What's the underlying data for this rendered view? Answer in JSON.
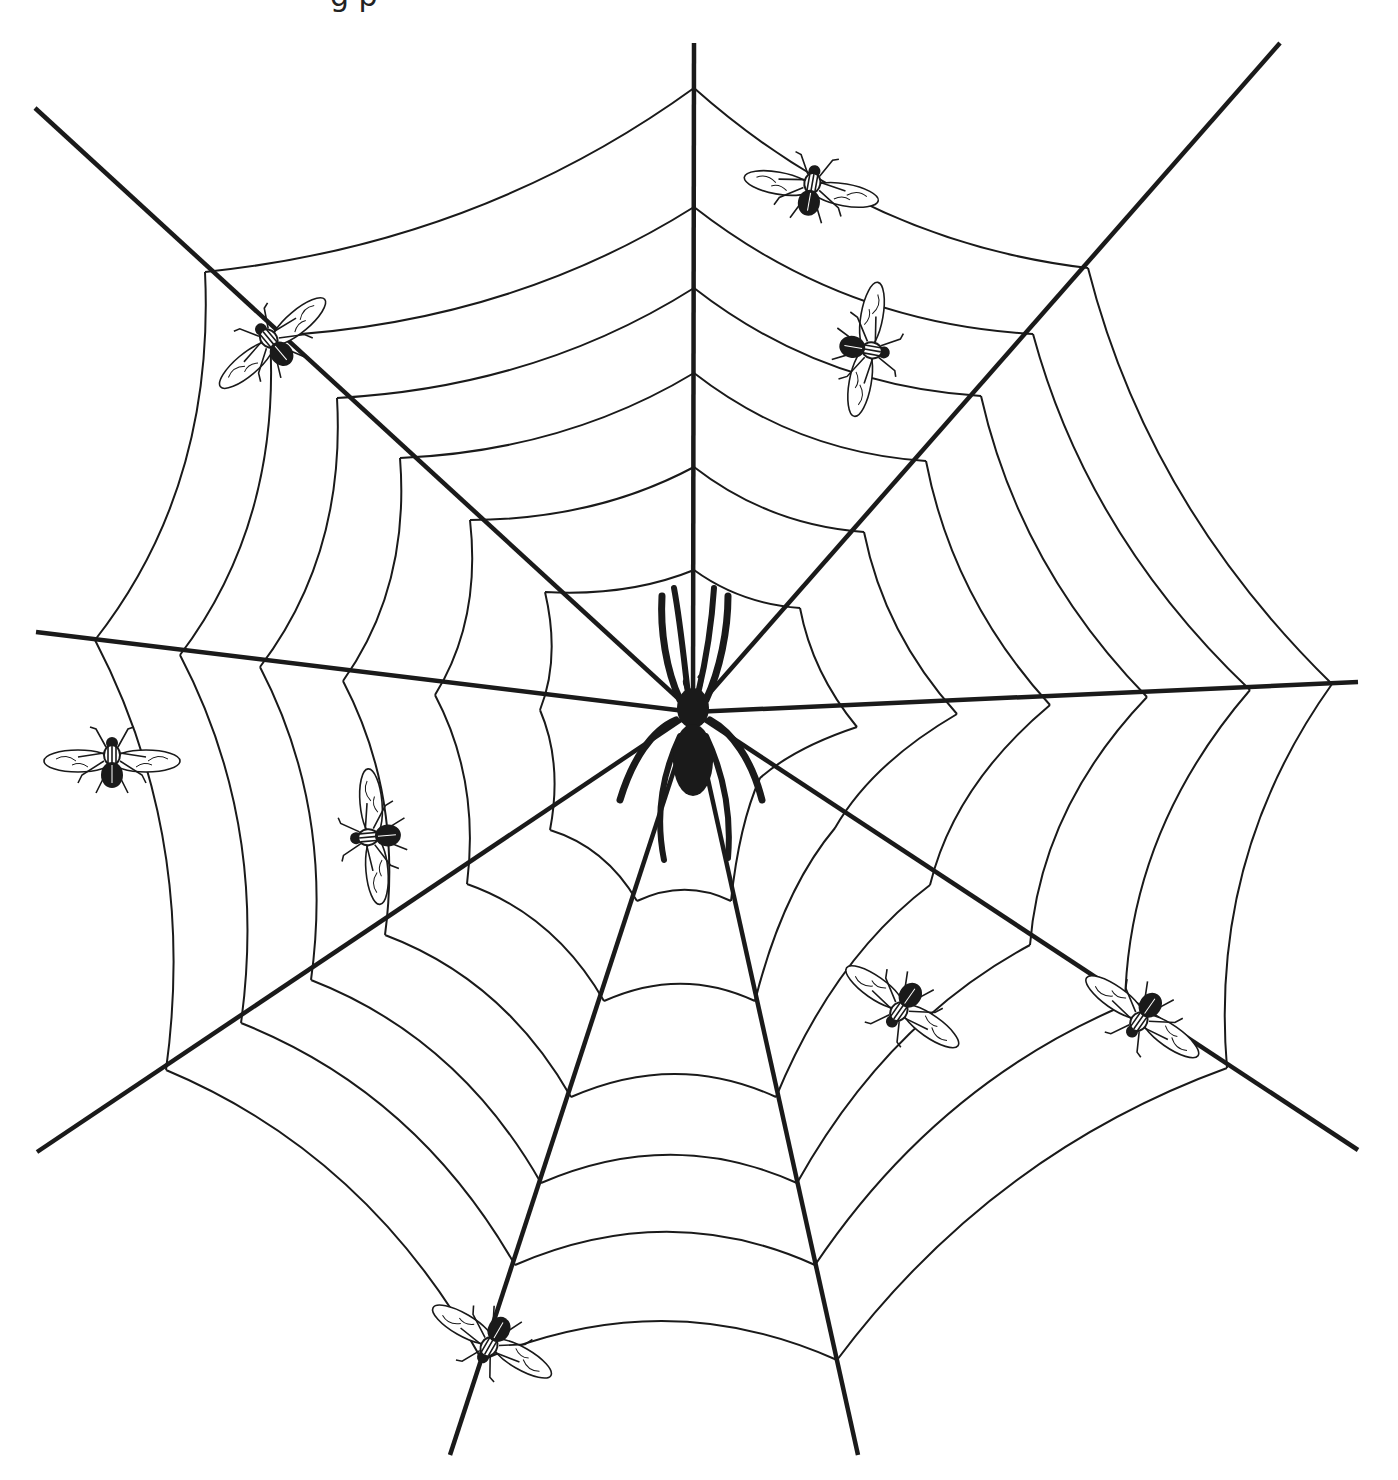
{
  "caption": {
    "text": "g        p",
    "note_visible": "only descenders of a cut-off text line are visible at the top edge"
  },
  "illustration": {
    "subject": "spider web with spider and flies",
    "colors": {
      "background": "#ffffff",
      "ink": "#1a1a1a"
    },
    "hub": [
      693,
      712
    ],
    "radials": [
      {
        "name": "top",
        "end": [
          694,
          43
        ]
      },
      {
        "name": "upper-right",
        "end": [
          1280,
          43
        ]
      },
      {
        "name": "right",
        "end": [
          1358,
          682
        ]
      },
      {
        "name": "lower-right",
        "end": [
          1358,
          1150
        ]
      },
      {
        "name": "bottom-right",
        "end": [
          858,
          1455
        ]
      },
      {
        "name": "bottom-left",
        "end": [
          450,
          1455
        ]
      },
      {
        "name": "lower-left",
        "end": [
          37,
          1152
        ]
      },
      {
        "name": "left",
        "end": [
          36,
          632
        ]
      },
      {
        "name": "upper-left",
        "end": [
          35,
          108
        ]
      }
    ],
    "rings": [
      [
        [
          694,
          88
        ],
        [
          1088,
          268
        ],
        [
          1332,
          684
        ],
        [
          1227,
          1068
        ],
        [
          837,
          1360
        ],
        [
          482,
          1360
        ],
        [
          166,
          1070
        ],
        [
          95,
          640
        ],
        [
          205,
          272
        ]
      ],
      [
        [
          694,
          207
        ],
        [
          1033,
          334
        ],
        [
          1250,
          690
        ],
        [
          1125,
          1005
        ],
        [
          815,
          1265
        ],
        [
          515,
          1265
        ],
        [
          241,
          1023
        ],
        [
          180,
          655
        ],
        [
          270,
          336
        ]
      ],
      [
        [
          694,
          288
        ],
        [
          981,
          396
        ],
        [
          1147,
          697
        ],
        [
          1030,
          945
        ],
        [
          797,
          1183
        ],
        [
          541,
          1183
        ],
        [
          311,
          980
        ],
        [
          260,
          667
        ],
        [
          337,
          398
        ]
      ],
      [
        [
          694,
          373
        ],
        [
          926,
          461
        ],
        [
          1050,
          705
        ],
        [
          930,
          885
        ],
        [
          776,
          1097
        ],
        [
          571,
          1097
        ],
        [
          385,
          935
        ],
        [
          343,
          681
        ],
        [
          400,
          458
        ]
      ],
      [
        [
          694,
          467
        ],
        [
          864,
          532
        ],
        [
          957,
          714
        ],
        [
          835,
          828
        ],
        [
          755,
          1001
        ],
        [
          604,
          1001
        ],
        [
          467,
          884
        ],
        [
          435,
          695
        ],
        [
          470,
          520
        ]
      ],
      [
        [
          694,
          570
        ],
        [
          800,
          608
        ],
        [
          857,
          727
        ],
        [
          760,
          778
        ],
        [
          731,
          901
        ],
        [
          637,
          901
        ],
        [
          550,
          830
        ],
        [
          540,
          710
        ],
        [
          545,
          592
        ]
      ]
    ],
    "spider": {
      "x": 693,
      "y": 730,
      "label": "spider"
    },
    "flies": [
      {
        "x": 270,
        "y": 340,
        "rot": -40,
        "label": "fly"
      },
      {
        "x": 812,
        "y": 185,
        "rot": 10,
        "label": "fly"
      },
      {
        "x": 870,
        "y": 350,
        "rot": 100,
        "label": "fly"
      },
      {
        "x": 112,
        "y": 757,
        "rot": 0,
        "label": "fly"
      },
      {
        "x": 370,
        "y": 837,
        "rot": -95,
        "label": "fly"
      },
      {
        "x": 900,
        "y": 1010,
        "rot": -145,
        "label": "fly"
      },
      {
        "x": 1140,
        "y": 1020,
        "rot": -145,
        "label": "fly"
      },
      {
        "x": 490,
        "y": 1345,
        "rot": -150,
        "label": "fly"
      }
    ]
  }
}
